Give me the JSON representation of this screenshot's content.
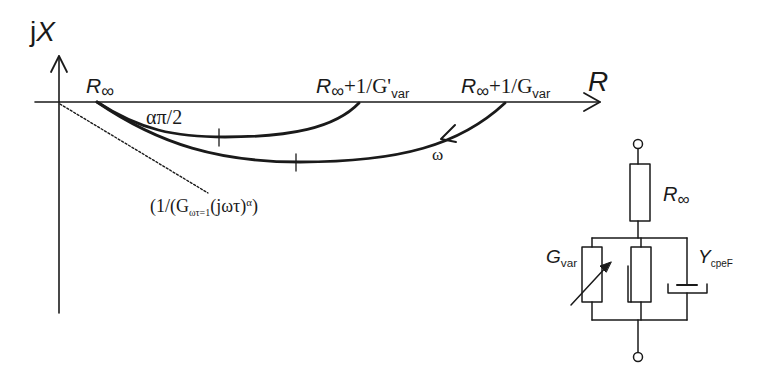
{
  "diagram": {
    "axes": {
      "y_label_prefix": "j",
      "y_label_var": "X",
      "x_label": "R"
    },
    "plot_labels": {
      "r_inf": {
        "base": "R",
        "sub": "∞"
      },
      "r_inf_plus_gprime": {
        "base": "R",
        "sub": "∞",
        "rest": "+1/G'",
        "rest_sub": "var"
      },
      "r_inf_plus_g": {
        "base": "R",
        "sub": "∞",
        "rest": "+1/G",
        "rest_sub": "var"
      },
      "angle": "απ/2",
      "omega": "ω",
      "cpe_line": {
        "pre": "(1/(G",
        "sub": "ωτ=1",
        "mid": "(jωτ)",
        "sup": "α",
        "post": ")"
      }
    },
    "circuit": {
      "r_inf": {
        "base": "R",
        "sub": "∞"
      },
      "g_var": {
        "base": "G",
        "sub": "var"
      },
      "y_cpe": {
        "base": "Y",
        "sub": "cpeF"
      }
    },
    "colors": {
      "ink": "#1a1a1a",
      "background": "#ffffff"
    }
  }
}
